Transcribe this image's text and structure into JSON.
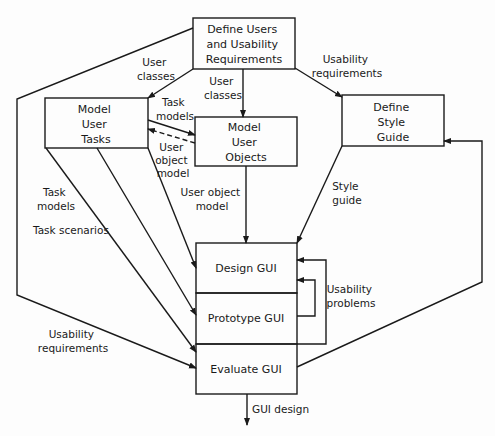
{
  "boxes": {
    "define_users": [
      "Define Users",
      "and Usability",
      "Requirements"
    ],
    "model_tasks": [
      "Model",
      "User",
      "Tasks"
    ],
    "model_objects": [
      "Model",
      "User",
      "Objects"
    ],
    "style_guide": [
      "Define",
      "Style",
      "Guide"
    ],
    "design_gui": "Design GUI",
    "prototype_gui": "Prototype GUI",
    "evaluate_gui": "Evaluate GUI"
  },
  "labels": {
    "user_classes_left": [
      "User",
      "classes"
    ],
    "user_classes_mid": [
      "User",
      "classes"
    ],
    "usability_req_top": [
      "Usability",
      "requirements"
    ],
    "task_models_top": [
      "Task",
      "models"
    ],
    "user_object_model_small": [
      "User",
      "object",
      "model"
    ],
    "user_object_model": [
      "User object",
      "model"
    ],
    "task_models_left": [
      "Task",
      "models"
    ],
    "task_scenarios": "Task scenarios",
    "style_guide": [
      "Style",
      "guide"
    ],
    "usability_problems": [
      "Usability",
      "problems"
    ],
    "usability_req_bottom": [
      "Usability",
      "requirements"
    ],
    "gui_design": "GUI design"
  },
  "colors": {
    "line": "#1a1a1a",
    "background": "#fdfdfd"
  }
}
